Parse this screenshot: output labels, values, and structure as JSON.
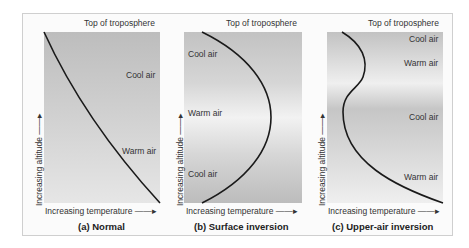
{
  "figure": {
    "top_label": "Top of troposphere",
    "x_axis_label": "Increasing temperature",
    "y_axis_label": "Increasing altitude",
    "arrow_glyph_right": "—▸",
    "arrow_glyph_up": "—▸"
  },
  "panels": [
    {
      "caption": "(a) Normal",
      "labels": [
        "Cool air",
        "Warm air"
      ]
    },
    {
      "caption": "(b) Surface inversion",
      "labels": [
        "Cool air",
        "Warm air",
        "Cool air"
      ]
    },
    {
      "caption": "(c) Upper-air inversion",
      "labels": [
        "Cool air",
        "Warm air",
        "Cool air",
        "Warm air"
      ]
    }
  ],
  "colors": {
    "curve": "#1a1a1a",
    "frame_border": "#cfcfcf",
    "plot_dark": "#bdbdbd",
    "plot_light": "#f0f0f0"
  }
}
